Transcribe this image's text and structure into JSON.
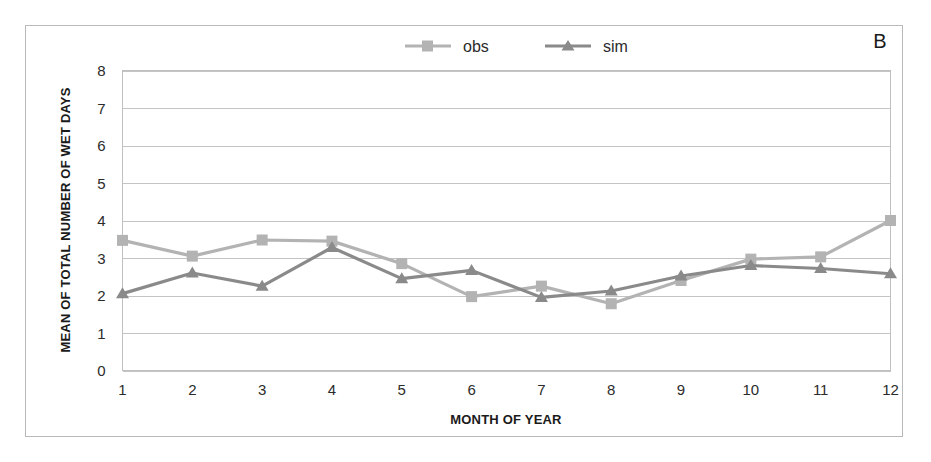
{
  "panel": {
    "label": "B"
  },
  "legend": {
    "position": "top-center",
    "entries": [
      {
        "name": "obs",
        "label": "obs",
        "color": "#b3b3b3",
        "marker": "square"
      },
      {
        "name": "sim",
        "label": "sim",
        "color": "#8a8a8a",
        "marker": "triangle"
      }
    ]
  },
  "chart_data": {
    "type": "line",
    "title": "",
    "subtitle": "",
    "xlabel": "MONTH OF YEAR",
    "ylabel": "MEAN OF TOTAL NUMBER OF WET DAYS",
    "x": [
      1,
      2,
      3,
      4,
      5,
      6,
      7,
      8,
      9,
      10,
      11,
      12
    ],
    "categories": [
      "1",
      "2",
      "3",
      "4",
      "5",
      "6",
      "7",
      "8",
      "9",
      "10",
      "11",
      "12"
    ],
    "xlim": [
      1,
      12
    ],
    "ylim": [
      0,
      8
    ],
    "ytick_labels": [
      "0",
      "1",
      "2",
      "3",
      "4",
      "5",
      "6",
      "7",
      "8"
    ],
    "yticks": [
      0,
      1,
      2,
      3,
      4,
      5,
      6,
      7,
      8
    ],
    "grid": "horizontal",
    "series": [
      {
        "name": "obs",
        "label": "obs",
        "color": "#b3b3b3",
        "marker": "square",
        "values": [
          3.47,
          3.05,
          3.48,
          3.45,
          2.85,
          1.97,
          2.25,
          1.78,
          2.4,
          2.97,
          3.03,
          4.0
        ]
      },
      {
        "name": "sim",
        "label": "sim",
        "color": "#8a8a8a",
        "marker": "triangle",
        "values": [
          2.05,
          2.6,
          2.25,
          3.28,
          2.45,
          2.67,
          1.95,
          2.12,
          2.52,
          2.8,
          2.72,
          2.58
        ]
      }
    ]
  }
}
